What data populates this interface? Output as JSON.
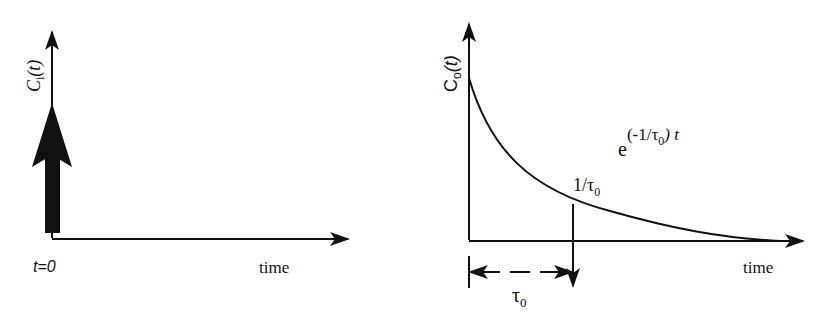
{
  "left_panel": {
    "y_axis_label_main": "C",
    "y_axis_label_sub": "i",
    "y_axis_label_arg": "(t)",
    "x_axis_label": "time",
    "origin_label": "t=0",
    "impulse": "delta input at t=0"
  },
  "right_panel": {
    "y_axis_label_main": "C",
    "y_axis_label_sub": "o",
    "y_axis_label_arg": "(t)",
    "x_axis_label": "time",
    "curve_label_base": "e",
    "curve_label_exponent": "(-1/τ",
    "curve_label_exponent_sub": "0",
    "curve_label_exponent_tail": ") t",
    "point_label": "1/τ",
    "point_label_sub": "0",
    "interval_label": "τ",
    "interval_label_sub": "0"
  },
  "colors": {
    "ink": "#111111",
    "background": "#ffffff"
  }
}
